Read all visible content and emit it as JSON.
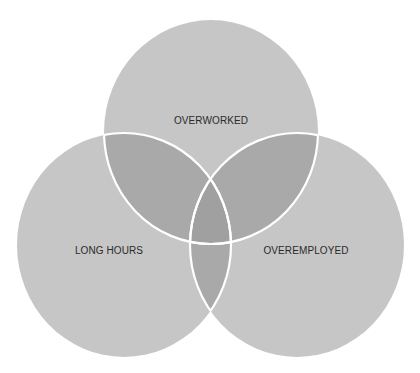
{
  "diagram": {
    "type": "venn",
    "sets": [
      {
        "id": "top",
        "label": "OVERWORKED",
        "cx": 211,
        "cy": 132,
        "rx": 107,
        "ry": 112,
        "label_x": 211,
        "label_y": 124
      },
      {
        "id": "left",
        "label": "LONG HOURS",
        "cx": 124,
        "cy": 245,
        "rx": 107,
        "ry": 112,
        "label_x": 109,
        "label_y": 254
      },
      {
        "id": "right",
        "label": "OVEREMPLOYED",
        "cx": 297,
        "cy": 245,
        "rx": 107,
        "ry": 112,
        "label_x": 306,
        "label_y": 254
      }
    ],
    "colors": {
      "single": "#c6c6c6",
      "double": "#a9a9a9",
      "triple": "#a0a0a0",
      "stroke": "#ffffff",
      "background": "#ffffff",
      "text": "#2a2a2a"
    }
  }
}
